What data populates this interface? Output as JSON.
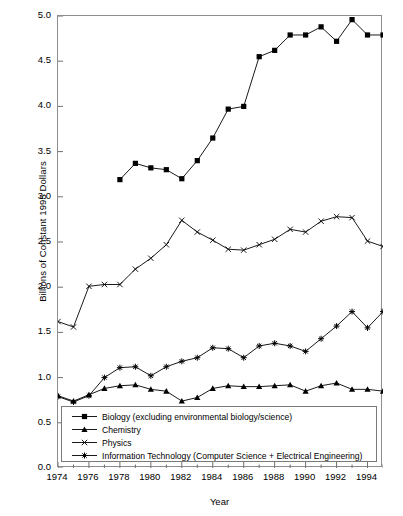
{
  "chart_data": {
    "type": "line",
    "title": "",
    "xlabel": "Year",
    "ylabel": "Billions of Constant 1995 Dollars",
    "xlim": [
      1974,
      1995
    ],
    "ylim": [
      0.0,
      5.0
    ],
    "grid": false,
    "legend_position": "bottom-center-inside",
    "y_ticks": [
      "0.0",
      "0.5",
      "1.0",
      "1.5",
      "2.0",
      "2.5",
      "3.0",
      "3.5",
      "4.0",
      "4.5",
      "5.0"
    ],
    "y_tick_values": [
      0.0,
      0.5,
      1.0,
      1.5,
      2.0,
      2.5,
      3.0,
      3.5,
      4.0,
      4.5,
      5.0
    ],
    "x_ticks": [
      "1974",
      "1976",
      "1978",
      "1980",
      "1982",
      "1984",
      "1986",
      "1988",
      "1990",
      "1992",
      "1994"
    ],
    "x_tick_values": [
      1974,
      1976,
      1978,
      1980,
      1982,
      1984,
      1986,
      1988,
      1990,
      1992,
      1994
    ],
    "x_minor_tick_values": [
      1975,
      1977,
      1979,
      1981,
      1983,
      1985,
      1987,
      1989,
      1991,
      1993,
      1995
    ],
    "series": [
      {
        "name": "Biology (excluding environmental biology/science)",
        "marker": "square",
        "color": "#000000",
        "x": [
          1978,
          1979,
          1980,
          1981,
          1982,
          1983,
          1984,
          1985,
          1986,
          1987,
          1988,
          1989,
          1990,
          1991,
          1992,
          1993,
          1994,
          1995
        ],
        "values": [
          3.19,
          3.37,
          3.32,
          3.3,
          3.2,
          3.4,
          3.65,
          3.97,
          4.0,
          4.55,
          4.62,
          4.79,
          4.79,
          4.88,
          4.72,
          4.96,
          4.79,
          4.79
        ]
      },
      {
        "name": "Chemistry",
        "marker": "triangle",
        "color": "#000000",
        "x": [
          1974,
          1975,
          1976,
          1977,
          1978,
          1979,
          1980,
          1981,
          1982,
          1983,
          1984,
          1985,
          1986,
          1987,
          1988,
          1989,
          1990,
          1991,
          1992,
          1993,
          1994,
          1995
        ],
        "values": [
          0.8,
          0.74,
          0.81,
          0.88,
          0.91,
          0.92,
          0.87,
          0.85,
          0.74,
          0.78,
          0.88,
          0.91,
          0.9,
          0.9,
          0.91,
          0.92,
          0.85,
          0.91,
          0.94,
          0.87,
          0.87,
          0.85
        ]
      },
      {
        "name": "Physics",
        "marker": "x",
        "color": "#000000",
        "x": [
          1974,
          1975,
          1976,
          1977,
          1978,
          1979,
          1980,
          1981,
          1982,
          1983,
          1984,
          1985,
          1986,
          1987,
          1988,
          1989,
          1990,
          1991,
          1992,
          1993,
          1994,
          1995
        ],
        "values": [
          1.62,
          1.56,
          2.01,
          2.03,
          2.03,
          2.2,
          2.32,
          2.47,
          2.74,
          2.61,
          2.52,
          2.42,
          2.41,
          2.47,
          2.53,
          2.64,
          2.61,
          2.73,
          2.78,
          2.77,
          2.51,
          2.45
        ]
      },
      {
        "name": "Information Technology (Computer Science + Electrical Engineering)",
        "marker": "star",
        "color": "#000000",
        "x": [
          1974,
          1975,
          1976,
          1977,
          1978,
          1979,
          1980,
          1981,
          1982,
          1983,
          1984,
          1985,
          1986,
          1987,
          1988,
          1989,
          1990,
          1991,
          1992,
          1993,
          1994,
          1995
        ],
        "values": [
          0.79,
          0.73,
          0.8,
          1.0,
          1.11,
          1.12,
          1.02,
          1.12,
          1.18,
          1.22,
          1.33,
          1.32,
          1.22,
          1.35,
          1.38,
          1.35,
          1.29,
          1.43,
          1.57,
          1.73,
          1.55,
          1.73
        ]
      }
    ]
  },
  "legend": {
    "items": [
      {
        "label": "Biology (excluding environmental biology/science)",
        "marker": "square"
      },
      {
        "label": "Chemistry",
        "marker": "triangle"
      },
      {
        "label": "Physics",
        "marker": "x"
      },
      {
        "label": "Information Technology (Computer Science + Electrical Engineering)",
        "marker": "star"
      }
    ]
  }
}
